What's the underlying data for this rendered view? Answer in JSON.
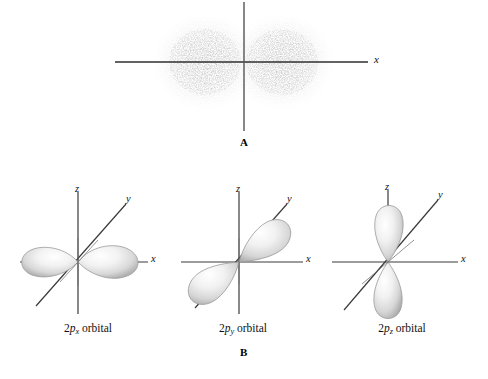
{
  "figure": {
    "title_text": "",
    "panels": [
      {
        "id": "A",
        "letter": "A",
        "kind": "electron-density-dot-cloud",
        "description": "Electron density dot plot of a 2p orbital showing two dense lobes on either side of the vertical nodal plane",
        "axes": [
          {
            "name": "x-axis",
            "label": "x",
            "orientation": "horizontal"
          },
          {
            "name": "vertical-axis",
            "label": "",
            "orientation": "vertical"
          }
        ]
      },
      {
        "id": "B",
        "letter": "B",
        "kind": "orbital-boundary-surfaces",
        "orbitals": [
          {
            "name": "2px",
            "caption_prefix": "2",
            "caption_var": "p",
            "caption_sub": "x",
            "caption_suffix": " orbital",
            "caption_full": "2px orbital",
            "lobe_orientation": "along x-axis (horizontal, left and right)",
            "axis_labels": {
              "z": "z",
              "y": "y",
              "x": "x"
            }
          },
          {
            "name": "2py",
            "caption_prefix": "2",
            "caption_var": "p",
            "caption_sub": "y",
            "caption_suffix": " orbital",
            "caption_full": "2py orbital",
            "lobe_orientation": "along y-axis (diagonal, upper-right and lower-left)",
            "axis_labels": {
              "z": "z",
              "y": "y",
              "x": "x"
            }
          },
          {
            "name": "2pz",
            "caption_prefix": "2",
            "caption_var": "p",
            "caption_sub": "z",
            "caption_suffix": " orbital",
            "caption_full": "2pz orbital",
            "lobe_orientation": "along z-axis (vertical, up and down)",
            "axis_labels": {
              "z": "z",
              "y": "y",
              "x": "x"
            }
          }
        ]
      }
    ]
  },
  "colors": {
    "background": "#ffffff",
    "axis_line": "#3a3a3a",
    "text": "#111111",
    "dot_cloud": "#999999",
    "lobe_light": "#fdfdfd",
    "lobe_mid": "#e2e2e2",
    "lobe_dark": "#b4b4b4",
    "lobe_outline": "#8e8e8e"
  }
}
